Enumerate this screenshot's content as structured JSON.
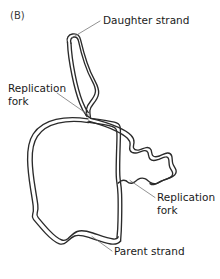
{
  "figure": {
    "panel_letter": "(B)",
    "background_color": "#ffffff",
    "stroke_color": "#2b2b2b",
    "leader_color": "#6d6d6d",
    "text_color": "#1a1a1a"
  },
  "labels": {
    "daughter_strand": "Daughter strand",
    "replication_fork_left_line1": "Replication",
    "replication_fork_left_line2": "fork",
    "replication_fork_right_line1": "Replication",
    "replication_fork_right_line2": "fork",
    "parent_strand": "Parent strand"
  },
  "diagram_data": {
    "type": "biological-schematic",
    "subject": "Replicating circular DNA molecule (theta structure)",
    "structures": [
      {
        "name": "daughter-strand-loop",
        "description": "Narrow elongated replicated loop extending upward from the left replication fork"
      },
      {
        "name": "parent-strand-loop",
        "description": "Large unreplicated circular loop occupying the lower left of the figure"
      },
      {
        "name": "right-daughter-lobe",
        "description": "Irregular wavy lobe on the right side between the two replication forks"
      }
    ],
    "forks": [
      {
        "name": "replication-fork-left",
        "x": 90,
        "y": 117
      },
      {
        "name": "replication-fork-right",
        "x": 127,
        "y": 181
      }
    ]
  }
}
